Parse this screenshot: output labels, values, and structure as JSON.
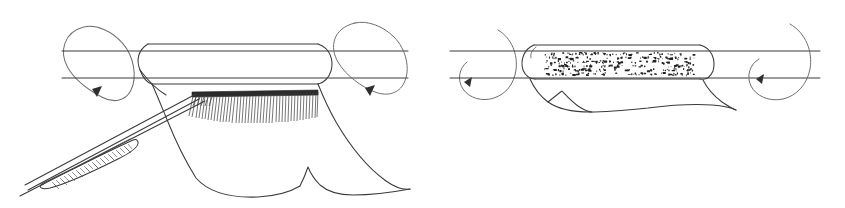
{
  "figure": {
    "title": "Rotating cylinder with brush applicator and coated sleeve",
    "caption": "",
    "background_color": "#ffffff",
    "ink_color": "#3a3a3a",
    "accent_color": "#2b2b2b",
    "width": 845,
    "height": 208,
    "panels": [
      {
        "id": "left",
        "name": "panel-left",
        "label": "",
        "description": "Rotating cylindrical roller with a draped sheet, a brush-head applicator and a hatched handle tool",
        "parts": [
          {
            "name": "cylinder-body",
            "label": ""
          },
          {
            "name": "rotation-arrow-left",
            "label": "",
            "direction": "counter-clockwise"
          },
          {
            "name": "rotation-arrow-right",
            "label": "",
            "direction": "counter-clockwise"
          },
          {
            "name": "draped-sheet",
            "label": ""
          },
          {
            "name": "brush-head",
            "label": "",
            "bristle_count": 52
          },
          {
            "name": "tool-handle",
            "label": ""
          },
          {
            "name": "hatched-grip",
            "label": "",
            "hatch_lines": 30
          }
        ]
      },
      {
        "id": "right",
        "name": "panel-right",
        "label": "",
        "description": "Rotating cylindrical roller with a stippled coated sleeve and a short flat drape",
        "parts": [
          {
            "name": "cylinder-body",
            "label": ""
          },
          {
            "name": "coated-sleeve",
            "label": ""
          },
          {
            "name": "stipple-texture",
            "label": "",
            "speck_count": 320
          },
          {
            "name": "rotation-arrow-left",
            "label": "",
            "direction": "clockwise"
          },
          {
            "name": "rotation-arrow-right",
            "label": "",
            "direction": "clockwise"
          },
          {
            "name": "draped-sheet",
            "label": ""
          }
        ]
      }
    ]
  },
  "chart_data": {
    "type": "diagram",
    "title": "Rotating cylinder with brush applicator and coated sleeve",
    "panels": 2,
    "annotations": []
  }
}
